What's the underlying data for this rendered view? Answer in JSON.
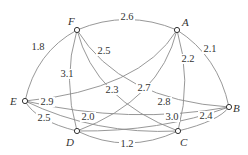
{
  "diagram": {
    "type": "weighted-graph",
    "nodes": [
      {
        "id": "F",
        "label": "F",
        "x": 77,
        "y": 30,
        "lx": 68,
        "ly": 25
      },
      {
        "id": "A",
        "label": "A",
        "x": 177,
        "y": 30,
        "lx": 182,
        "ly": 26
      },
      {
        "id": "E",
        "label": "E",
        "x": 25,
        "y": 101,
        "lx": 10,
        "ly": 105
      },
      {
        "id": "B",
        "label": "B",
        "x": 229,
        "y": 107,
        "lx": 233,
        "ly": 112
      },
      {
        "id": "D",
        "label": "D",
        "x": 77,
        "y": 131,
        "lx": 66,
        "ly": 146
      },
      {
        "id": "C",
        "label": "C",
        "x": 178,
        "y": 131,
        "lx": 180,
        "ly": 146
      }
    ],
    "edges": [
      {
        "from": "F",
        "to": "A",
        "weight": "2.6",
        "path": "M77,30 Q127,9 177,30",
        "lx": 127,
        "ly": 20
      },
      {
        "from": "F",
        "to": "E",
        "weight": "1.8",
        "path": "M77,30 Q36,52 25,101",
        "lx": 38,
        "ly": 50
      },
      {
        "from": "A",
        "to": "B",
        "weight": "2.1",
        "path": "M177,30 Q218,56 229,107",
        "lx": 210,
        "ly": 52
      },
      {
        "from": "E",
        "to": "D",
        "weight": "2.5",
        "path": "M25,101 Q36,121 77,131",
        "lx": 44,
        "ly": 121
      },
      {
        "from": "D",
        "to": "C",
        "weight": "1.2",
        "path": "M77,131 Q127,155 178,131",
        "lx": 127,
        "ly": 147
      },
      {
        "from": "C",
        "to": "B",
        "weight": "2.4",
        "path": "M178,131 Q219,121 229,107",
        "lx": 206,
        "ly": 119
      },
      {
        "from": "E",
        "to": "A",
        "weight": "2.9",
        "path": "M25,101 Q140,90 177,30",
        "lx": 47,
        "ly": 105
      },
      {
        "from": "F",
        "to": "B",
        "weight": "2.5",
        "path": "M77,30 Q120,100 229,107",
        "lx": 104,
        "ly": 54
      },
      {
        "from": "F",
        "to": "D",
        "weight": "3.1",
        "path": "M77,30 Q62,80 77,131",
        "lx": 67,
        "ly": 77
      },
      {
        "from": "F",
        "to": "C",
        "weight": "2.3",
        "path": "M77,30 Q95,100 178,131",
        "lx": 112,
        "ly": 93
      },
      {
        "from": "A",
        "to": "D",
        "weight": "2.7",
        "path": "M177,30 Q160,100 77,131",
        "lx": 144,
        "ly": 91
      },
      {
        "from": "A",
        "to": "C",
        "weight": "2.2",
        "path": "M177,30 Q192,80 178,131",
        "lx": 188,
        "ly": 62
      },
      {
        "from": "E",
        "to": "B",
        "weight": "2.8",
        "path": "M25,101 Q130,125 229,107",
        "lx": 164,
        "ly": 105
      },
      {
        "from": "E",
        "to": "C",
        "weight": "2.0",
        "path": "M25,101 Q95,135 178,131",
        "lx": 88,
        "ly": 120
      },
      {
        "from": "D",
        "to": "B",
        "weight": "3.0",
        "path": "M77,131 Q160,132 229,107",
        "lx": 172,
        "ly": 120
      }
    ]
  }
}
